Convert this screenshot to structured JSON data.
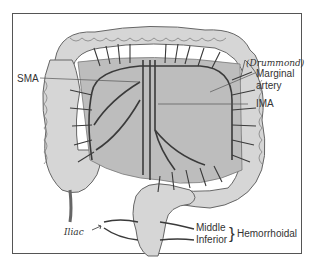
{
  "figure": {
    "labels": {
      "sma": "SMA",
      "marginal_line1": "Marginal",
      "marginal_line2": "artery",
      "drummond": "(Drummond)",
      "ima": "IMA",
      "middle": "Middle",
      "inferior": "Inferior",
      "brace": "}",
      "hemorrhoidal": "Hemorrhoidal",
      "iliac": "Iliac"
    },
    "colors": {
      "colon_fill": "#d6d6d6",
      "mesentery_fill": "#bdbdbd",
      "vessel": "#3a3a3a",
      "outline": "#555555",
      "text": "#333333"
    }
  }
}
